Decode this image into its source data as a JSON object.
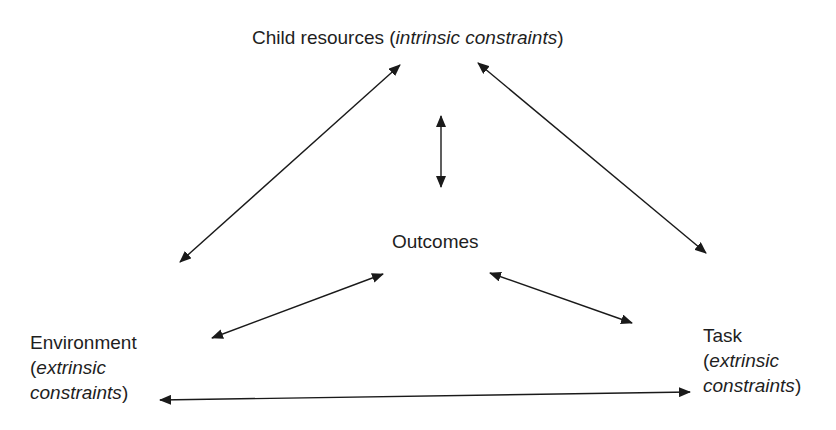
{
  "diagram": {
    "nodes": {
      "child": {
        "main": "Child resources (",
        "italic": "intrinsic constraints",
        "close": ")"
      },
      "outcomes": {
        "main": "Outcomes"
      },
      "environment": {
        "main": "Environment",
        "line2_open": "(",
        "line2_italic": "extrinsic",
        "line3_italic": "constraints",
        "line3_close": ")"
      },
      "task": {
        "main": "Task",
        "line2_open": "(",
        "line2_italic": "extrinsic",
        "line3_italic": "constraints",
        "line3_close": ")"
      }
    },
    "edges": [
      {
        "from": "child",
        "to": "environment",
        "type": "bidirectional"
      },
      {
        "from": "child",
        "to": "task",
        "type": "bidirectional"
      },
      {
        "from": "child",
        "to": "outcomes",
        "type": "bidirectional"
      },
      {
        "from": "environment",
        "to": "outcomes",
        "type": "bidirectional"
      },
      {
        "from": "outcomes",
        "to": "task",
        "type": "bidirectional"
      },
      {
        "from": "environment",
        "to": "task",
        "type": "bidirectional"
      }
    ],
    "colors": {
      "text": "#1e1e1e",
      "arrow": "#1a1a1a",
      "background": "#ffffff"
    }
  }
}
